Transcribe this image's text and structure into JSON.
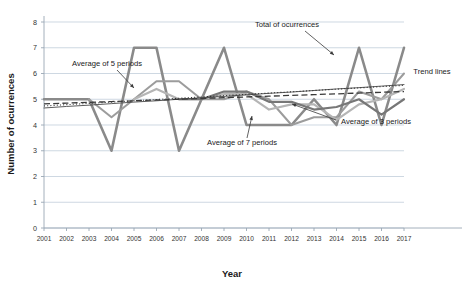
{
  "chart_data": {
    "type": "line",
    "title": "",
    "xlabel": "Year",
    "ylabel": "Number of ocurrences",
    "grid": true,
    "legend_position": "none",
    "xlim": [
      2001,
      2017
    ],
    "ylim": [
      0,
      8
    ],
    "yticks": [
      0,
      1,
      2,
      3,
      4,
      5,
      6,
      7,
      8
    ],
    "categories": [
      "2001",
      "2002",
      "2003",
      "2004",
      "2005",
      "2006",
      "2007",
      "2008",
      "2009",
      "2010",
      "2011",
      "2012",
      "2013",
      "2014",
      "2015",
      "2016",
      "2017"
    ],
    "x": [
      2001,
      2002,
      2003,
      2004,
      2005,
      2006,
      2007,
      2008,
      2009,
      2010,
      2011,
      2012,
      2013,
      2014,
      2015,
      2016,
      2017
    ],
    "series": [
      {
        "name": "Total of ocurrences",
        "style": "solid",
        "color": "#8a8a8a",
        "width": 2.6,
        "values": [
          5,
          5,
          5,
          3,
          7,
          7,
          3,
          5,
          7,
          4,
          4,
          4,
          5,
          4,
          7,
          4,
          7
        ]
      },
      {
        "name": "Average of 3 periods",
        "style": "solid",
        "color": "#9c9c9c",
        "width": 2.0,
        "values": [
          null,
          null,
          5.0,
          4.3,
          5.0,
          5.7,
          5.7,
          5.0,
          5.0,
          5.3,
          5.0,
          4.0,
          4.3,
          4.3,
          5.3,
          5.0,
          6.0
        ]
      },
      {
        "name": "Average of 5 periods",
        "style": "solid",
        "color": "#b5b5b5",
        "width": 2.2,
        "values": [
          null,
          null,
          null,
          null,
          5.0,
          5.4,
          5.0,
          5.0,
          5.2,
          5.2,
          4.6,
          4.8,
          4.8,
          4.2,
          4.8,
          5.0,
          5.4
        ]
      },
      {
        "name": "Average of 7 periods",
        "style": "solid",
        "color": "#777777",
        "width": 2.2,
        "values": [
          null,
          null,
          null,
          null,
          null,
          null,
          5.0,
          5.0,
          5.3,
          5.3,
          4.9,
          4.9,
          4.6,
          4.7,
          5.0,
          4.4,
          5.0
        ]
      },
      {
        "name": "Trend line (linear)",
        "style": "solid-thin",
        "color": "#4a4a4a",
        "width": 0.9,
        "values": [
          4.66,
          4.72,
          4.77,
          4.83,
          4.89,
          4.94,
          5.0,
          5.06,
          5.11,
          5.17,
          5.23,
          5.28,
          5.34,
          5.4,
          5.45,
          5.51,
          5.57
        ]
      },
      {
        "name": "Trend line (dotted)",
        "style": "dotted",
        "color": "#2f2f2f",
        "width": 1.1,
        "values": [
          4.74,
          4.79,
          4.84,
          4.89,
          4.94,
          4.99,
          5.04,
          5.09,
          5.14,
          5.19,
          5.24,
          5.29,
          5.34,
          5.39,
          5.44,
          5.49,
          5.54
        ]
      },
      {
        "name": "Trend line (dashed)",
        "style": "dashed",
        "color": "#3a3a3a",
        "width": 1.3,
        "values": [
          4.82,
          4.85,
          4.88,
          4.91,
          4.94,
          4.97,
          5.0,
          5.03,
          5.06,
          5.09,
          5.12,
          5.15,
          5.18,
          5.21,
          5.24,
          5.27,
          5.3
        ]
      }
    ],
    "annotations": [
      {
        "key": "total",
        "label": "Total of ocurrences",
        "x": 287,
        "y": 27,
        "anchor": "middle",
        "leader": [
          [
            305,
            31
          ],
          [
            334,
            55
          ]
        ]
      },
      {
        "key": "avg5",
        "label": "Average of 5 periods",
        "x": 107,
        "y": 66,
        "anchor": "middle",
        "leader": [
          [
            117,
            70
          ],
          [
            134,
            88
          ]
        ]
      },
      {
        "key": "avg7",
        "label": "Average of 7 periods",
        "x": 242,
        "y": 145,
        "anchor": "middle",
        "leader": [
          [
            247,
            138
          ],
          [
            252,
            116
          ]
        ]
      },
      {
        "key": "avg3",
        "label": "Average of 3 periods",
        "x": 376,
        "y": 124,
        "anchor": "middle",
        "leader": [
          [
            336,
            120
          ],
          [
            292,
            104
          ]
        ]
      },
      {
        "key": "trend",
        "label": "Trend lines",
        "x": 432,
        "y": 74,
        "anchor": "middle",
        "leader": []
      }
    ]
  }
}
